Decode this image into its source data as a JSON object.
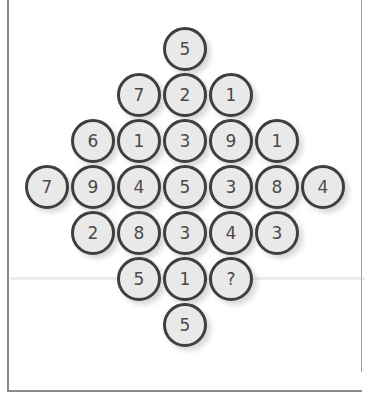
{
  "puzzle": {
    "type": "number-diamond",
    "rows": [
      [
        "5"
      ],
      [
        "7",
        "2",
        "1"
      ],
      [
        "6",
        "1",
        "3",
        "9",
        "1"
      ],
      [
        "7",
        "9",
        "4",
        "5",
        "3",
        "8",
        "4"
      ],
      [
        "2",
        "8",
        "3",
        "4",
        "3"
      ],
      [
        "5",
        "1",
        "?"
      ],
      [
        "5"
      ]
    ],
    "missing_symbol": "?"
  },
  "layout": {
    "center_x": 184,
    "row_y": [
      48,
      94,
      140,
      186,
      232,
      278,
      324
    ],
    "spacing": 46,
    "radius": 21
  },
  "colors": {
    "circle_fill": "#e9e9e9",
    "circle_border": "#3f3f3f",
    "text": "#4a4a4a",
    "frame": "#8a8a8a"
  }
}
